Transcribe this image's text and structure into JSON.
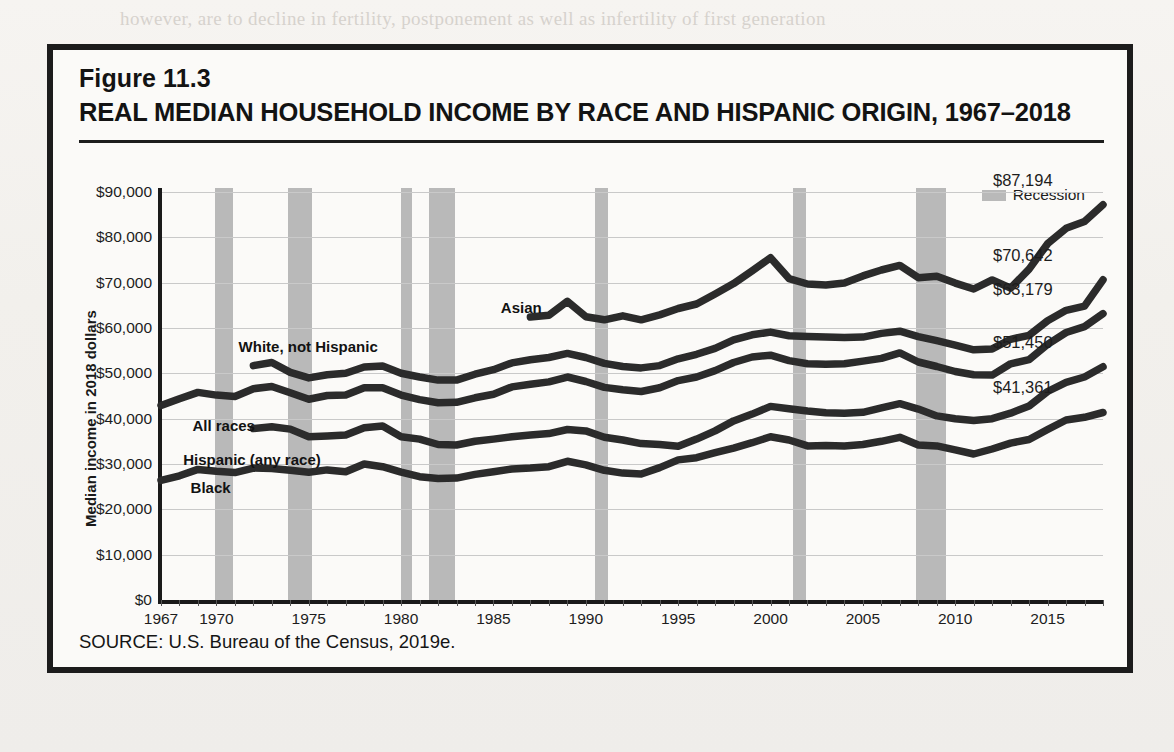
{
  "page_background_text": [
    {
      "text": "however, are to decline in fertility, postponement as well as infertility of first generation",
      "x": 120,
      "y": 8
    },
    {
      "text": "Eastern Europe, the Caribbean, and Mexico.",
      "x": 118,
      "y": 58
    },
    {
      "text": "for some dignity and for those who are likely to remain in relatively disadvantaged",
      "x": 118,
      "y": 125
    },
    {
      "text": "immigrant and its associated kinship structure reflect suffering the more disparate",
      "x": 118,
      "y": 150
    },
    {
      "text": "patterns with the driving (2015). Further, there is a steady climb in the rate of growth",
      "x": 118,
      "y": 175
    },
    {
      "text": "associated with those of non-Hispanic, those whites maintained, and patterns in a disrup-",
      "x": 118,
      "y": 260
    },
    {
      "text": "tive analysis at higher levels that for whites below than for the Census of white and black",
      "x": 118,
      "y": 288
    },
    {
      "text": "households; in 1995 levels, then there are more of the most affluent and upward mobile",
      "x": 118,
      "y": 315
    },
    {
      "text": "and the structural mobility on their conditions where these are the shared",
      "x": 118,
      "y": 343
    },
    {
      "text": "characteristics of the broader economic and social patterns.",
      "x": 118,
      "y": 480
    },
    {
      "text": "Those of those under-represented in American households and health of lower-income",
      "x": 118,
      "y": 508
    },
    {
      "text": "minorities, Asian race considered the greatest share by far of higher of the lowest",
      "x": 118,
      "y": 535
    },
    {
      "text": "generation at each further along the poor is much higher from the income group to others",
      "x": 118,
      "y": 562
    },
    {
      "text": "imagine the south than levels 1.8-2.2 times increase the highest, 20 percent of children",
      "x": 118,
      "y": 592
    },
    {
      "text": "exceed by the United States, the type of infant mortality also.",
      "x": 118,
      "y": 620
    }
  ],
  "figure": {
    "label": "Figure 11.3",
    "title": "REAL MEDIAN HOUSEHOLD INCOME BY RACE AND HISPANIC ORIGIN, 1967–2018",
    "source": "SOURCE: U.S. Bureau of the Census, 2019e."
  },
  "legend": {
    "recession_label": "Recession",
    "recession_color": "#b9b9b9"
  },
  "chart_data": {
    "type": "line",
    "title": "REAL MEDIAN HOUSEHOLD INCOME BY RACE AND HISPANIC ORIGIN, 1967–2018",
    "xlabel": "",
    "ylabel": "Median income in 2018 dollars",
    "xlim": [
      1967,
      2018
    ],
    "ylim": [
      0,
      90000
    ],
    "grid": true,
    "legend_position": "top-right",
    "ytick_labels": [
      "$90,000",
      "$80,000",
      "$70,000",
      "$60,000",
      "$50,000",
      "$40,000",
      "$30,000",
      "$20,000",
      "$10,000",
      "$0"
    ],
    "ytick_values": [
      90000,
      80000,
      70000,
      60000,
      50000,
      40000,
      30000,
      20000,
      10000,
      0
    ],
    "xtick_labels": [
      "1967",
      "1970",
      "1975",
      "1980",
      "1985",
      "1990",
      "1995",
      "2000",
      "2005",
      "2010",
      "2015"
    ],
    "xtick_values": [
      1967,
      1970,
      1975,
      1980,
      1985,
      1990,
      1995,
      2000,
      2005,
      2010,
      2015
    ],
    "line_color": "#2b2b2b",
    "recessions": [
      {
        "start": 1969.9,
        "end": 1970.9
      },
      {
        "start": 1973.9,
        "end": 1975.2
      },
      {
        "start": 1980.0,
        "end": 1980.6
      },
      {
        "start": 1981.5,
        "end": 1982.9
      },
      {
        "start": 1990.5,
        "end": 1991.2
      },
      {
        "start": 2001.2,
        "end": 2001.9
      },
      {
        "start": 2007.9,
        "end": 2009.5
      }
    ],
    "series": [
      {
        "name": "Asian",
        "label": "Asian",
        "label_x": 1985.4,
        "label_y": 64500,
        "end_label": "$87,194",
        "end_value": 87194,
        "x": [
          1987,
          1988,
          1989,
          1990,
          1991,
          1992,
          1993,
          1994,
          1995,
          1996,
          1997,
          1998,
          1999,
          2000,
          2001,
          2002,
          2003,
          2004,
          2005,
          2006,
          2007,
          2008,
          2009,
          2010,
          2011,
          2012,
          2013,
          2014,
          2015,
          2016,
          2017,
          2018
        ],
        "y": [
          62400,
          62800,
          65900,
          62500,
          61800,
          62700,
          61800,
          62900,
          64300,
          65300,
          67500,
          69800,
          72600,
          75500,
          70900,
          69700,
          69500,
          69900,
          71500,
          72800,
          73800,
          71100,
          71400,
          69900,
          68600,
          70600,
          68800,
          73000,
          78600,
          82000,
          83500,
          87194
        ]
      },
      {
        "name": "White, not Hispanic",
        "label": "White, not Hispanic",
        "label_x": 1971.2,
        "label_y": 55900,
        "end_label": "$70,642",
        "end_value": 70642,
        "x": [
          1972,
          1973,
          1974,
          1975,
          1976,
          1977,
          1978,
          1979,
          1980,
          1981,
          1982,
          1983,
          1984,
          1985,
          1986,
          1987,
          1988,
          1989,
          1990,
          1991,
          1992,
          1993,
          1994,
          1995,
          1996,
          1997,
          1998,
          1999,
          2000,
          2001,
          2002,
          2003,
          2004,
          2005,
          2006,
          2007,
          2008,
          2009,
          2010,
          2011,
          2012,
          2013,
          2014,
          2015,
          2016,
          2017,
          2018
        ],
        "y": [
          51700,
          52400,
          50200,
          49000,
          49700,
          50000,
          51400,
          51600,
          50000,
          49200,
          48500,
          48500,
          49800,
          50800,
          52300,
          53000,
          53500,
          54400,
          53500,
          52200,
          51500,
          51200,
          51700,
          53200,
          54200,
          55500,
          57400,
          58500,
          59100,
          58300,
          58100,
          58000,
          57900,
          58000,
          58800,
          59300,
          58100,
          57200,
          56200,
          55200,
          55400,
          57500,
          58400,
          61600,
          63900,
          64800,
          70642
        ]
      },
      {
        "name": "All races",
        "label": "All races",
        "label_x": 1968.7,
        "label_y": 38400,
        "end_label": "$63,179",
        "end_value": 63179,
        "x": [
          1967,
          1968,
          1969,
          1970,
          1971,
          1972,
          1973,
          1974,
          1975,
          1976,
          1977,
          1978,
          1979,
          1980,
          1981,
          1982,
          1983,
          1984,
          1985,
          1986,
          1987,
          1988,
          1989,
          1990,
          1991,
          1992,
          1993,
          1994,
          1995,
          1996,
          1997,
          1998,
          1999,
          2000,
          2001,
          2002,
          2003,
          2004,
          2005,
          2006,
          2007,
          2008,
          2009,
          2010,
          2011,
          2012,
          2013,
          2014,
          2015,
          2016,
          2017,
          2018
        ],
        "y": [
          42900,
          44400,
          45800,
          45200,
          44900,
          46600,
          47100,
          45700,
          44300,
          45100,
          45200,
          46800,
          46800,
          45200,
          44200,
          43500,
          43600,
          44600,
          45400,
          47000,
          47600,
          48100,
          49200,
          48200,
          46900,
          46400,
          46000,
          46800,
          48400,
          49200,
          50600,
          52400,
          53600,
          54000,
          52800,
          52100,
          52000,
          52100,
          52700,
          53300,
          54500,
          52500,
          51500,
          50400,
          49700,
          49600,
          52100,
          53000,
          56400,
          59000,
          60300,
          63179
        ]
      },
      {
        "name": "Hispanic (any race)",
        "label": "Hispanic (any race)",
        "label_x": 1968.2,
        "label_y": 30800,
        "end_label": "$51,450",
        "end_value": 51450,
        "x": [
          1972,
          1973,
          1974,
          1975,
          1976,
          1977,
          1978,
          1979,
          1980,
          1981,
          1982,
          1983,
          1984,
          1985,
          1986,
          1987,
          1988,
          1989,
          1990,
          1991,
          1992,
          1993,
          1994,
          1995,
          1996,
          1997,
          1998,
          1999,
          2000,
          2001,
          2002,
          2003,
          2004,
          2005,
          2006,
          2007,
          2008,
          2009,
          2010,
          2011,
          2012,
          2013,
          2014,
          2015,
          2016,
          2017,
          2018
        ],
        "y": [
          37800,
          38200,
          37700,
          36000,
          36200,
          36400,
          38000,
          38400,
          36000,
          35500,
          34300,
          34200,
          35000,
          35500,
          36000,
          36400,
          36700,
          37600,
          37300,
          35900,
          35300,
          34500,
          34300,
          33900,
          35500,
          37300,
          39500,
          41000,
          42700,
          42200,
          41700,
          41300,
          41200,
          41400,
          42400,
          43300,
          42100,
          40600,
          40000,
          39600,
          40000,
          41200,
          42800,
          46000,
          48000,
          49200,
          51450
        ]
      },
      {
        "name": "Black",
        "label": "Black",
        "label_x": 1968.6,
        "label_y": 24800,
        "end_label": "$41,361",
        "end_value": 41361,
        "x": [
          1967,
          1968,
          1969,
          1970,
          1971,
          1972,
          1973,
          1974,
          1975,
          1976,
          1977,
          1978,
          1979,
          1980,
          1981,
          1982,
          1983,
          1984,
          1985,
          1986,
          1987,
          1988,
          1989,
          1990,
          1991,
          1992,
          1993,
          1994,
          1995,
          1996,
          1997,
          1998,
          1999,
          2000,
          2001,
          2002,
          2003,
          2004,
          2005,
          2006,
          2007,
          2008,
          2009,
          2010,
          2011,
          2012,
          2013,
          2014,
          2015,
          2016,
          2017,
          2018
        ],
        "y": [
          26400,
          27400,
          28800,
          28400,
          28100,
          29100,
          29000,
          28600,
          28200,
          28700,
          28300,
          30000,
          29400,
          28200,
          27200,
          26800,
          26900,
          27700,
          28300,
          28900,
          29100,
          29400,
          30600,
          29800,
          28600,
          28000,
          27800,
          29200,
          30900,
          31400,
          32500,
          33500,
          34700,
          36000,
          35300,
          34000,
          34100,
          34000,
          34300,
          35000,
          35900,
          34200,
          34000,
          33100,
          32200,
          33300,
          34600,
          35400,
          37600,
          39700,
          40300,
          41361
        ]
      }
    ]
  }
}
